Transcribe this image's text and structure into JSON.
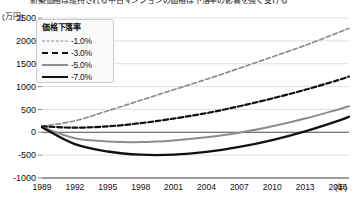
{
  "title": "新築価格は維持される中古マンションの価格は下落率の影響を強く受ける",
  "y_axis_unit": "(万円)",
  "x_axis_unit": "(年)",
  "legend": {
    "title": "価格下落率",
    "items": [
      {
        "label": "-1.0%",
        "style": "fine-dashed",
        "color": "#8d8d8d"
      },
      {
        "label": "-3.0%",
        "style": "bold-dashed",
        "color": "#101010"
      },
      {
        "label": "-5.0%",
        "style": "solid",
        "color": "#8d8d8d"
      },
      {
        "label": "-7.0%",
        "style": "thick-solid",
        "color": "#101010"
      }
    ]
  },
  "chart_data": {
    "type": "line",
    "title": "新築価格は維持される中古マンションの価格は下落率の影響を強く受ける",
    "xlabel": "(年)",
    "ylabel": "(万円)",
    "ylim": [
      -1000,
      2500
    ],
    "yticks": [
      2500,
      2000,
      1500,
      1000,
      500,
      0,
      -500,
      -1000
    ],
    "ytick_labels": [
      "2500",
      "2000",
      "1500",
      "1000",
      "500",
      "0",
      "-500",
      "-1000"
    ],
    "xlim": [
      1989,
      2017
    ],
    "xticks": [
      1989,
      1992,
      1995,
      1998,
      2001,
      2004,
      2007,
      2010,
      2013,
      2016
    ],
    "xtick_labels": [
      "1989",
      "1992",
      "1995",
      "1998",
      "2001",
      "2004",
      "2007",
      "2010",
      "2013",
      "2016"
    ],
    "grid": true,
    "legend_position": "upper-left",
    "x": [
      1989,
      1992,
      1995,
      1998,
      2001,
      2004,
      2007,
      2010,
      2013,
      2016,
      2017
    ],
    "series": [
      {
        "name": "-1.0%",
        "values": [
          130,
          250,
          470,
          700,
          930,
          1160,
          1400,
          1650,
          1900,
          2180,
          2270
        ]
      },
      {
        "name": "-3.0%",
        "values": [
          130,
          100,
          130,
          200,
          300,
          420,
          570,
          740,
          930,
          1140,
          1220
        ]
      },
      {
        "name": "-5.0%",
        "values": [
          110,
          -130,
          -200,
          -215,
          -180,
          -110,
          -10,
          130,
          300,
          500,
          570
        ]
      },
      {
        "name": "-7.0%",
        "values": [
          110,
          -260,
          -420,
          -490,
          -490,
          -430,
          -320,
          -170,
          20,
          250,
          340
        ]
      }
    ]
  }
}
